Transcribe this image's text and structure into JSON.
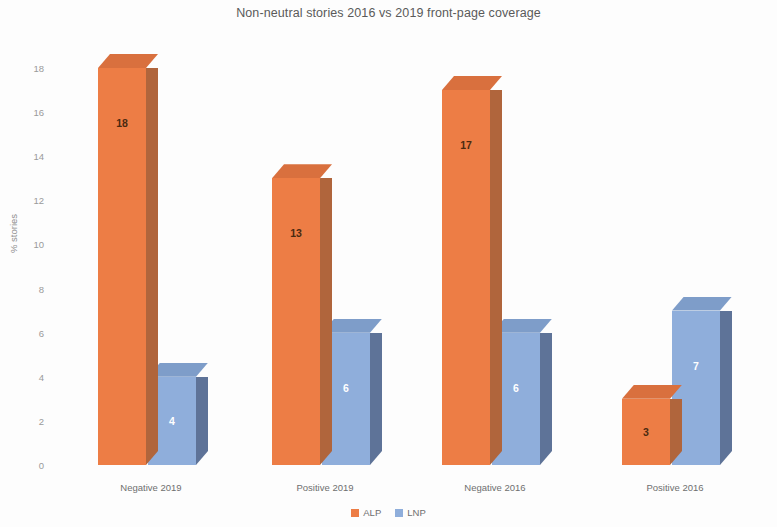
{
  "chart_data": {
    "type": "bar",
    "title": "Non-neutral stories 2016 vs 2019 front-page coverage",
    "xlabel": "",
    "ylabel": "% stories",
    "categories": [
      "Negative 2019",
      "Positive 2019",
      "Negative 2016",
      "Positive 2016"
    ],
    "series": [
      {
        "name": "ALP",
        "color": "#ED7D45",
        "side_color": "#B0653C",
        "top_color": "#D9703E",
        "label_color": "#4a2a10",
        "values": [
          18,
          13,
          17,
          3
        ]
      },
      {
        "name": "LNP",
        "color": "#8FAEDB",
        "side_color": "#5E7398",
        "top_color": "#7E9DC9",
        "label_color": "#ffffff",
        "values": [
          4,
          6,
          6,
          7
        ]
      }
    ],
    "ylim": [
      0,
      18
    ],
    "yticks": [
      0,
      2,
      4,
      6,
      8,
      10,
      12,
      14,
      16,
      18
    ],
    "ytick_labels": [
      "0",
      "2",
      "4",
      "6",
      "8",
      "10",
      "12",
      "14",
      "16",
      "18"
    ],
    "grid": false,
    "legend_position": "bottom",
    "style": "3d-column"
  },
  "legend": {
    "items": [
      {
        "label": "ALP",
        "color": "#ED7D45"
      },
      {
        "label": "LNP",
        "color": "#8FAEDB"
      }
    ]
  }
}
